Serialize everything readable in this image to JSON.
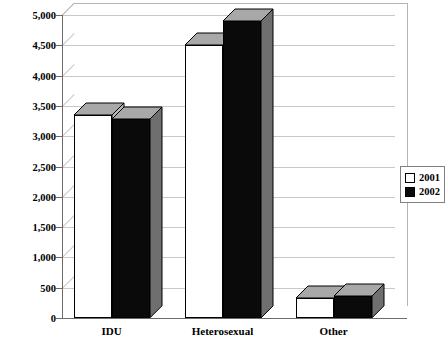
{
  "chart_data": {
    "type": "bar",
    "title": "",
    "subtitle": "",
    "xlabel": "",
    "ylabel": "",
    "categories": [
      "IDU",
      "Heterosexual",
      "Other"
    ],
    "series": [
      {
        "name": "2001",
        "values": [
          3350,
          4500,
          330
        ],
        "color": "#ffffff"
      },
      {
        "name": "2002",
        "values": [
          3280,
          4900,
          360
        ],
        "color": "#0a0a0a"
      }
    ],
    "ylim": [
      0,
      5000
    ],
    "ytick_values": [
      0,
      500,
      1000,
      1500,
      2000,
      2500,
      3000,
      3500,
      4000,
      4500,
      5000
    ],
    "ytick_labels": [
      "0",
      "500",
      "1,000",
      "1,500",
      "2,000",
      "2,500",
      "3,000",
      "3,500",
      "4,000",
      "4,500",
      "5,000"
    ],
    "grid": true,
    "legend_position": "right",
    "style": "3d-column"
  },
  "legend": {
    "entries": [
      {
        "label": "2001",
        "swatch": "hollow-square-icon"
      },
      {
        "label": "2002",
        "swatch": "filled-square-icon"
      }
    ]
  },
  "colors": {
    "series_2001": "#ffffff",
    "series_2002": "#0a0a0a",
    "gridline": "#c8c8c8",
    "axis": "#6b6b6b",
    "depth_shade": "#9a9a9a",
    "background": "#ffffff"
  }
}
